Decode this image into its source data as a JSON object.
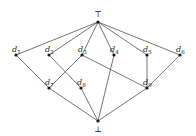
{
  "diagram": {
    "type": "hasse-lattice",
    "nodes": [
      {
        "id": "top",
        "label": "⊤",
        "x": 98,
        "y": 22,
        "label_pos": "above"
      },
      {
        "id": "d1",
        "label": "d",
        "sub": "1",
        "x": 16,
        "y": 55
      },
      {
        "id": "d2",
        "label": "d",
        "sub": "2",
        "x": 49,
        "y": 55
      },
      {
        "id": "d3",
        "label": "d",
        "sub": "3",
        "x": 82,
        "y": 55
      },
      {
        "id": "d4",
        "label": "d",
        "sub": "4",
        "x": 114,
        "y": 55
      },
      {
        "id": "d5",
        "label": "d",
        "sub": "5",
        "x": 147,
        "y": 55
      },
      {
        "id": "d6",
        "label": "d",
        "sub": "6",
        "x": 180,
        "y": 55
      },
      {
        "id": "d7",
        "label": "d",
        "sub": "7",
        "x": 49,
        "y": 88
      },
      {
        "id": "d8",
        "label": "d",
        "sub": "8",
        "x": 81,
        "y": 88
      },
      {
        "id": "d9",
        "label": "d",
        "sub": "9",
        "x": 147,
        "y": 88
      },
      {
        "id": "bot",
        "label": "⊥",
        "x": 98,
        "y": 121,
        "label_pos": "below"
      }
    ],
    "edges": [
      [
        "top",
        "d1"
      ],
      [
        "top",
        "d2"
      ],
      [
        "top",
        "d3"
      ],
      [
        "top",
        "d4"
      ],
      [
        "top",
        "d5"
      ],
      [
        "top",
        "d6"
      ],
      [
        "d1",
        "d7"
      ],
      [
        "d2",
        "d8"
      ],
      [
        "d3",
        "d7"
      ],
      [
        "d3",
        "d9"
      ],
      [
        "d4",
        "bot"
      ],
      [
        "d5",
        "d9"
      ],
      [
        "d6",
        "d9"
      ],
      [
        "d7",
        "bot"
      ],
      [
        "d8",
        "bot"
      ],
      [
        "d9",
        "bot"
      ]
    ]
  }
}
